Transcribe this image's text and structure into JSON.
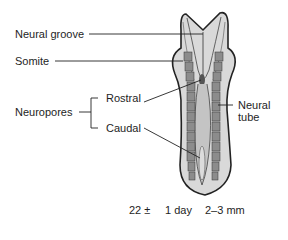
{
  "diagram": {
    "labels": {
      "neural_groove": "Neural groove",
      "somite": "Somite",
      "neuropores": "Neuropores",
      "rostral": "Rostral",
      "caudal": "Caudal",
      "neural_tube_line1": "Neural",
      "neural_tube_line2": "tube"
    },
    "caption": {
      "age": "22 ±",
      "age_range": "1 day",
      "size": "2–3 mm"
    },
    "colors": {
      "body_fill": "#d9d9d9",
      "outline": "#222222",
      "somite_fill": "#8c8c8c",
      "neural_fill": "#c4c4c4",
      "text": "#1e1e1e"
    }
  }
}
